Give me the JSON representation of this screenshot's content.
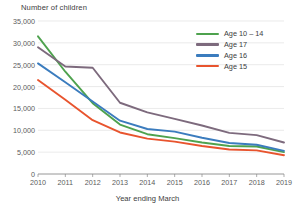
{
  "chart_data": {
    "type": "line",
    "title": "",
    "ylabel": "Number of children",
    "xlabel": "Year ending March",
    "x": [
      2010,
      2011,
      2012,
      2013,
      2014,
      2015,
      2016,
      2017,
      2018,
      2019
    ],
    "tick_labels_x": [
      "2010",
      "2011",
      "2012",
      "2013",
      "2014",
      "2015",
      "2016",
      "2017",
      "2018",
      "2019"
    ],
    "tick_labels_y": [
      "0",
      "5,000",
      "10,000",
      "15,000",
      "20,000",
      "25,000",
      "30,000",
      "35,000"
    ],
    "ylim": [
      0,
      35000
    ],
    "ytick_values": [
      0,
      5000,
      10000,
      15000,
      20000,
      25000,
      30000,
      35000
    ],
    "grid": "horizontal",
    "legend_position": "top-right",
    "series": [
      {
        "name": "Age 10 – 14",
        "color": "#4ea24e",
        "values": [
          31500,
          23400,
          16200,
          11300,
          9100,
          8200,
          7200,
          6400,
          6300,
          5000
        ]
      },
      {
        "name": "Age 17",
        "color": "#7d6a7d",
        "values": [
          29000,
          24600,
          24300,
          16300,
          14100,
          12600,
          11100,
          9400,
          8900,
          7200
        ]
      },
      {
        "name": "Age 16",
        "color": "#3b7cbe",
        "values": [
          25300,
          21000,
          16600,
          12200,
          10300,
          9700,
          8300,
          7100,
          6700,
          5300
        ]
      },
      {
        "name": "Age 15",
        "color": "#e8542e",
        "values": [
          21500,
          17000,
          12300,
          9500,
          8100,
          7400,
          6400,
          5600,
          5400,
          4300
        ]
      }
    ]
  }
}
